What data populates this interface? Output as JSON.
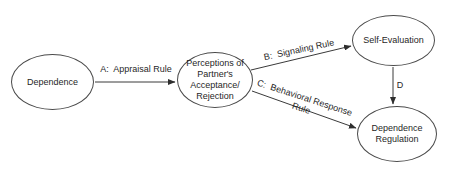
{
  "diagram": {
    "colors": {
      "ink": "#1f1f1f",
      "outline": "#4a4a4a",
      "background": "#ffffff"
    },
    "nodes": {
      "dependence": {
        "label": "Dependence"
      },
      "perceptions": {
        "label": "Perceptions of\nPartner's\nAcceptance/\nRejection"
      },
      "self_evaluation": {
        "label": "Self-Evaluation"
      },
      "dependence_regulation": {
        "label": "Dependence\nRegulation"
      }
    },
    "edges": {
      "a": {
        "label": "A:  Appraisal Rule"
      },
      "b": {
        "label": "B:  Signaling Rule"
      },
      "c": {
        "label": "C:  Behavioral Response\nRule"
      },
      "d": {
        "label": "D"
      }
    }
  }
}
